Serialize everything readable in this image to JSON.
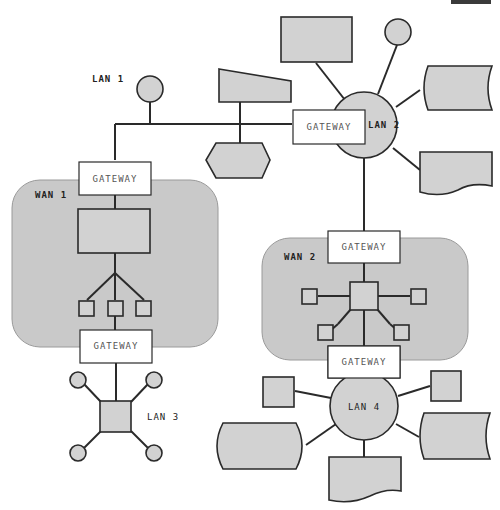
{
  "diagram": {
    "type": "network-topology",
    "colors": {
      "node_fill": "#d2d2d2",
      "wan_fill": "#c9c9c9",
      "gateway_fill": "#ffffff",
      "line": "#2a2a2a"
    },
    "labels": {
      "lan1": "LAN 1",
      "lan2": "LAN 2",
      "lan3": "LAN 3",
      "lan4": "LAN 4",
      "wan1": "WAN 1",
      "wan2": "WAN 2"
    },
    "gateways": {
      "lan1_lan2": "GATEWAY",
      "wan1_top": "GATEWAY",
      "wan1_bottom": "GATEWAY",
      "wan2_top": "GATEWAY",
      "wan2_bottom": "GATEWAY"
    },
    "networks": [
      {
        "name": "LAN 1",
        "topology": "bus",
        "nodes": [
          "circle",
          "trapezoid",
          "hexagon"
        ]
      },
      {
        "name": "LAN 2",
        "topology": "star",
        "nodes": [
          "rectangle",
          "circle",
          "storage",
          "document"
        ]
      },
      {
        "name": "WAN 1",
        "topology": "tree",
        "nodes": [
          "rectangle",
          "square",
          "square",
          "square"
        ]
      },
      {
        "name": "WAN 2",
        "topology": "star",
        "nodes": [
          "square",
          "square",
          "square",
          "square",
          "square"
        ]
      },
      {
        "name": "LAN 3",
        "topology": "star",
        "nodes": [
          "square",
          "circle",
          "circle",
          "circle",
          "circle"
        ]
      },
      {
        "name": "LAN 4",
        "topology": "star",
        "nodes": [
          "square",
          "square",
          "storage",
          "storage",
          "document"
        ]
      }
    ]
  }
}
